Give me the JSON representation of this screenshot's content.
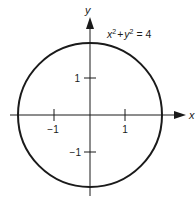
{
  "diagram": {
    "equation": {
      "base": "x",
      "exp": "2",
      "plus": "+",
      "base2": "y",
      "exp2": "2",
      "rhs": "= 4"
    },
    "axes": {
      "x_label": "x",
      "y_label": "y"
    },
    "ticks": {
      "x": [
        {
          "value": -1,
          "label": "−1"
        },
        {
          "value": 1,
          "label": "1"
        }
      ],
      "y": [
        {
          "value": 1,
          "label": "1"
        },
        {
          "value": -1,
          "label": "−1"
        }
      ]
    },
    "circle": {
      "center": [
        0,
        0
      ],
      "radius": 2
    },
    "colors": {
      "stroke": "#1a1a1a",
      "background": "#ffffff"
    }
  }
}
